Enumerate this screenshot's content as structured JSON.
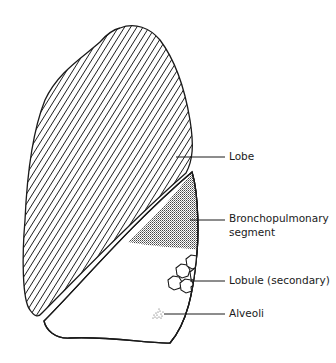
{
  "diagram": {
    "colors": {
      "outline": "#1a1a1a",
      "hatch": "#1a1a1a",
      "stipple": "#555555",
      "background": "#ffffff"
    },
    "labels": [
      {
        "id": "lobe",
        "text": "Lobe",
        "line2": ""
      },
      {
        "id": "bronchopulmonary-segment",
        "text": "Bronchopulmonary",
        "line2": "segment"
      },
      {
        "id": "lobule",
        "text": "Lobule (secondary)",
        "line2": ""
      },
      {
        "id": "alveoli",
        "text": "Alveoli",
        "line2": ""
      }
    ]
  }
}
